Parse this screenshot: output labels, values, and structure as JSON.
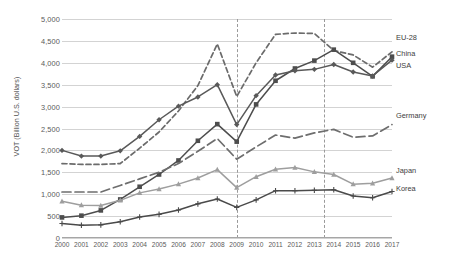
{
  "chart_data": {
    "type": "line",
    "title": "",
    "xlabel": "",
    "ylabel": "VOT (Billion U.S. dollars)",
    "x": [
      2000,
      2001,
      2002,
      2003,
      2004,
      2005,
      2006,
      2007,
      2008,
      2009,
      2010,
      2011,
      2012,
      2013,
      2014,
      2015,
      2016,
      2017
    ],
    "xtick_labels": [
      "2000",
      "2001",
      "2002",
      "2003",
      "2004",
      "2005",
      "2006",
      "2007",
      "2008",
      "2009",
      "2010",
      "2011",
      "2012",
      "2013",
      "2014",
      "2015",
      "2016",
      "2017"
    ],
    "ylim": [
      0,
      5000
    ],
    "ytick_values": [
      0,
      500,
      1000,
      1500,
      2000,
      2500,
      3000,
      3500,
      4000,
      4500,
      5000
    ],
    "ytick_labels": [
      "0",
      "500",
      "1,000",
      "1,500",
      "2,000",
      "2,500",
      "3,000",
      "3,500",
      "4,000",
      "4,500",
      "5,000"
    ],
    "grid": true,
    "legend_position": "right-inline",
    "annotations": [
      {
        "type": "vertical-dashed-line",
        "x": 2009
      },
      {
        "type": "vertical-dashed-line",
        "x": 2013.5
      }
    ],
    "series": [
      {
        "name": "EU-28",
        "color": "#6b6b6b",
        "style": "dashed",
        "marker": "none",
        "label_y_value": 4560,
        "values": [
          1700,
          1680,
          1680,
          1700,
          2050,
          2420,
          2900,
          3480,
          4430,
          3230,
          4000,
          4650,
          4680,
          4670,
          4280,
          4180,
          3900,
          4250
        ]
      },
      {
        "name": "China",
        "color": "#4d4d4d",
        "style": "solid",
        "marker": "square",
        "label_y_value": 4200,
        "values": [
          470,
          510,
          630,
          880,
          1170,
          1450,
          1770,
          2220,
          2600,
          2200,
          3050,
          3590,
          3870,
          4050,
          4300,
          4000,
          3690,
          4140
        ]
      },
      {
        "name": "USA",
        "color": "#595959",
        "style": "solid",
        "marker": "diamond",
        "label_y_value": 3920,
        "values": [
          2000,
          1870,
          1870,
          1990,
          2320,
          2700,
          3010,
          3220,
          3500,
          2590,
          3250,
          3720,
          3820,
          3850,
          3960,
          3790,
          3700,
          4060
        ]
      },
      {
        "name": "Germany",
        "color": "#6e6e6e",
        "style": "long-dash",
        "marker": "none",
        "label_y_value": 2780,
        "values": [
          1050,
          1050,
          1050,
          1200,
          1350,
          1500,
          1700,
          1980,
          2270,
          1800,
          2080,
          2350,
          2280,
          2400,
          2480,
          2300,
          2330,
          2590
        ]
      },
      {
        "name": "Japan",
        "color": "#9e9e9e",
        "style": "solid",
        "marker": "triangle",
        "label_y_value": 1520,
        "values": [
          840,
          750,
          740,
          860,
          1030,
          1120,
          1230,
          1370,
          1560,
          1150,
          1400,
          1570,
          1610,
          1510,
          1450,
          1230,
          1250,
          1370
        ]
      },
      {
        "name": "Korea",
        "color": "#4a4a4a",
        "style": "solid",
        "marker": "plus",
        "label_y_value": 1120,
        "values": [
          330,
          290,
          300,
          370,
          480,
          540,
          640,
          780,
          890,
          700,
          870,
          1080,
          1080,
          1090,
          1100,
          960,
          920,
          1060
        ]
      }
    ]
  }
}
